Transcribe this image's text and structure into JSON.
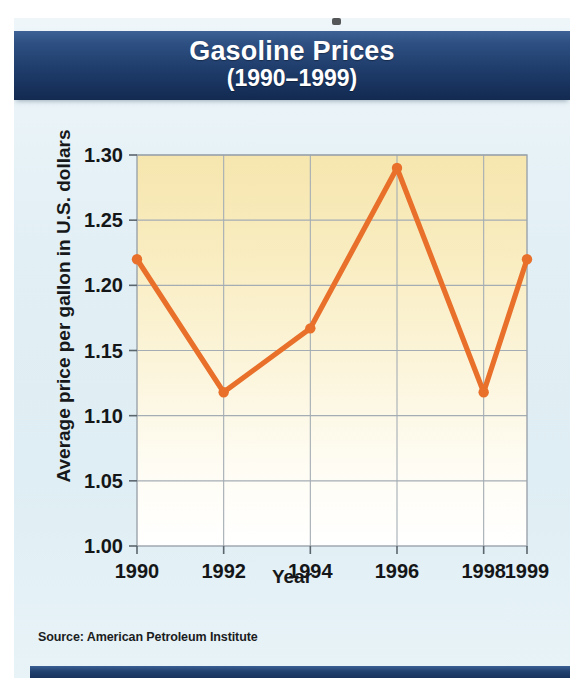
{
  "figure": {
    "title_main": "Gasoline Prices",
    "title_sub": "(1990–1999)",
    "source": "Source: American Petroleum Institute",
    "accent_color": "#e8702a",
    "banner_color": "#1f3d6b",
    "plot_fill_top": "#f7e9b8",
    "background_color": "#e2eff5"
  },
  "chart_data": {
    "type": "line",
    "title": "Gasoline Prices (1990–1999)",
    "xlabel": "Year",
    "ylabel": "Average price per gallon in U.S. dollars",
    "x": [
      1990,
      1992,
      1994,
      1996,
      1998,
      1999
    ],
    "values": [
      1.22,
      1.118,
      1.167,
      1.29,
      1.118,
      1.22
    ],
    "series": [
      {
        "name": "Average price per gallon",
        "values": [
          1.22,
          1.118,
          1.167,
          1.29,
          1.118,
          1.22
        ]
      }
    ],
    "xlim": [
      1990,
      1999
    ],
    "ylim": [
      1.0,
      1.3
    ],
    "xticks": [
      1990,
      1992,
      1994,
      1996,
      1998,
      1999
    ],
    "xtick_labels": [
      "1990",
      "1992",
      "1994",
      "1996",
      "1998",
      "1999"
    ],
    "yticks": [
      1.0,
      1.05,
      1.1,
      1.15,
      1.2,
      1.25,
      1.3
    ],
    "ytick_labels": [
      "1.00",
      "1.05",
      "1.10",
      "1.15",
      "1.20",
      "1.25",
      "1.30"
    ],
    "grid": true,
    "legend": false,
    "marker": "circle",
    "line_color": "#e8702a",
    "annotations": [
      "Source: American Petroleum Institute"
    ]
  }
}
